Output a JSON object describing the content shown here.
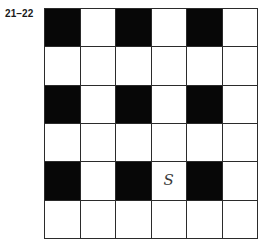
{
  "figure": {
    "label": "21–22",
    "background_color": "#ffffff",
    "line_color": "#2b2b2b",
    "fill_color": "#070707",
    "empty_color": "#ffffff",
    "mark_color": "#3a3a3a"
  },
  "grid": {
    "columns": 6,
    "rows": 6,
    "cells": [
      [
        {
          "state": "filled",
          "mark": ""
        },
        {
          "state": "empty",
          "mark": ""
        },
        {
          "state": "filled",
          "mark": ""
        },
        {
          "state": "empty",
          "mark": ""
        },
        {
          "state": "filled",
          "mark": ""
        },
        {
          "state": "empty",
          "mark": ""
        }
      ],
      [
        {
          "state": "empty",
          "mark": ""
        },
        {
          "state": "empty",
          "mark": ""
        },
        {
          "state": "empty",
          "mark": ""
        },
        {
          "state": "empty",
          "mark": ""
        },
        {
          "state": "empty",
          "mark": ""
        },
        {
          "state": "empty",
          "mark": ""
        }
      ],
      [
        {
          "state": "filled",
          "mark": ""
        },
        {
          "state": "empty",
          "mark": ""
        },
        {
          "state": "filled",
          "mark": ""
        },
        {
          "state": "empty",
          "mark": ""
        },
        {
          "state": "filled",
          "mark": ""
        },
        {
          "state": "empty",
          "mark": ""
        }
      ],
      [
        {
          "state": "empty",
          "mark": ""
        },
        {
          "state": "empty",
          "mark": ""
        },
        {
          "state": "empty",
          "mark": ""
        },
        {
          "state": "empty",
          "mark": ""
        },
        {
          "state": "empty",
          "mark": ""
        },
        {
          "state": "empty",
          "mark": ""
        }
      ],
      [
        {
          "state": "filled",
          "mark": ""
        },
        {
          "state": "empty",
          "mark": ""
        },
        {
          "state": "filled",
          "mark": ""
        },
        {
          "state": "empty",
          "mark": "S"
        },
        {
          "state": "filled",
          "mark": ""
        },
        {
          "state": "empty",
          "mark": ""
        }
      ],
      [
        {
          "state": "empty",
          "mark": ""
        },
        {
          "state": "empty",
          "mark": ""
        },
        {
          "state": "empty",
          "mark": ""
        },
        {
          "state": "empty",
          "mark": ""
        },
        {
          "state": "empty",
          "mark": ""
        },
        {
          "state": "empty",
          "mark": ""
        }
      ]
    ]
  }
}
